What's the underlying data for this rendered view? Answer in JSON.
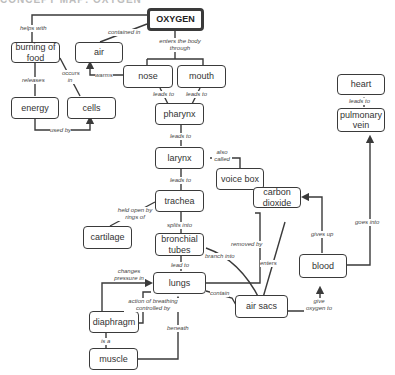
{
  "header": {
    "title_cut": "CONCEPT MAP: OXYGEN"
  },
  "nodes": {
    "oxygen": "OXYGEN",
    "burning": "burning of food",
    "air": "air",
    "nose": "nose",
    "mouth": "mouth",
    "energy": "energy",
    "cells": "cells",
    "pharynx": "pharynx",
    "larynx": "larynx",
    "voicebox": "voice box",
    "trachea": "trachea",
    "cartilage": "cartilage",
    "bronchial": "bronchial tubes",
    "lungs": "lungs",
    "diaphragm": "diaphragm",
    "muscle": "muscle",
    "airsacs": "air sacs",
    "co2": "carbon dioxide",
    "blood": "blood",
    "pulmvein": "pulmonary vein",
    "heart": "heart"
  },
  "links": {
    "helps_with": "helps with",
    "contained_in": "contained in",
    "enters_body": "enters the body through",
    "releases": "releases",
    "occurs_in": "occurs in",
    "warms": "warms",
    "used_by": "used by",
    "leads_to_nose": "leads to",
    "leads_to_mouth": "leads to",
    "leads_to_pharynx": "leads to",
    "also_called": "also called",
    "leads_to_larynx": "leads to",
    "held_open": "held open by rings of",
    "splits_into": "splits into",
    "lead_to": "lead to",
    "branch_into": "branch into",
    "removed_by": "removed by",
    "enters": "enters",
    "changes_pressure": "changes pressure in",
    "action_breathing": "action of breathing controlled by",
    "contain": "contain",
    "is_a": "is a",
    "beneath": "beneath",
    "gives_up": "gives up",
    "give_oxygen": "give oxygen to",
    "goes_into": "goes into",
    "leads_to_heart": "leads to"
  },
  "colors": {
    "line": "#3a3a3a",
    "text": "#333333",
    "background": "#ffffff"
  }
}
